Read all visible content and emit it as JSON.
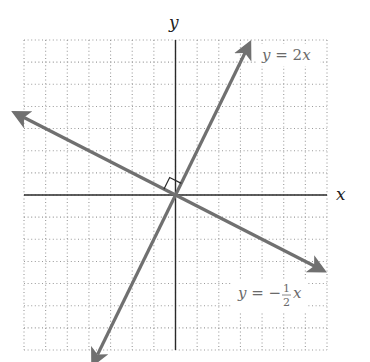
{
  "chart_data": {
    "type": "line",
    "title": "",
    "xlabel": "x",
    "ylabel": "y",
    "xlim": [
      -7,
      7
    ],
    "ylim": [
      -7,
      7
    ],
    "grid": true,
    "grid_style": "dotted",
    "tick_labels": false,
    "series": [
      {
        "name": "y = 2x",
        "equation": "y = 2x",
        "slope": 2,
        "intercept": 0,
        "x": [
          -3.6,
          3.4
        ],
        "y": [
          -7.2,
          6.8
        ],
        "arrows": "both",
        "color": "#707070"
      },
      {
        "name": "y = -1/2 x",
        "equation": "y = -(1/2)x",
        "slope": -0.5,
        "intercept": 0,
        "x": [
          -7,
          6.8
        ],
        "y": [
          3.5,
          -3.4
        ],
        "arrows": "both",
        "color": "#707070"
      }
    ],
    "annotations": [
      {
        "type": "right-angle-marker",
        "at": [
          0,
          0
        ],
        "note": "lines are perpendicular"
      },
      {
        "type": "label",
        "text": "y = 2x",
        "near_series": 0
      },
      {
        "type": "label",
        "text": "y = -1/2 x",
        "near_series": 1
      }
    ]
  },
  "labels": {
    "x_axis": "x",
    "y_axis": "y",
    "line1": {
      "y": "y",
      "eq": " = 2",
      "x": "x"
    },
    "line2": {
      "y": "y",
      "eq": " = −",
      "num": "1",
      "den": "2",
      "x": "x"
    }
  },
  "colors": {
    "axis": "#2a2a2a",
    "grid": "#9a9a9a",
    "line": "#707070",
    "label": "#6a6a6a"
  }
}
